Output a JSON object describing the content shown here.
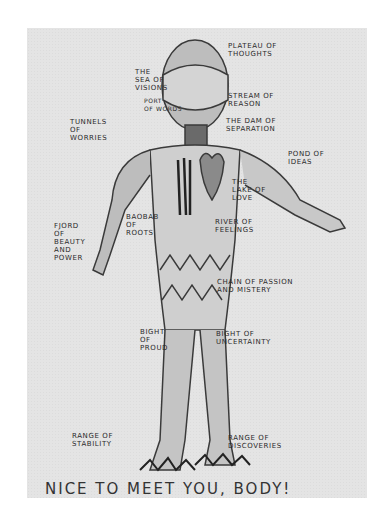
{
  "drawing": {
    "title_caption": "NICE TO MEET YOU, BODY!",
    "labels": {
      "plateau": "PLATEAU OF\nTHOUGHTS",
      "sea": "THE\nSEA OF\nVISIONS",
      "stream": "STREAM OF\nREASON",
      "words": "PORT\nOF WORDS",
      "tunnels": "TUNNELS\nOF\nWORRIES",
      "dam": "THE DAM OF\nSEPARATION",
      "pond": "POND OF\nIDEAS",
      "lake": "THE\nLAKE OF\nLOVE",
      "fjord": "FJORD\nOF\nBEAUTY\nAND\nPOWER",
      "baobab": "BAOBAB\nOF\nROOTS",
      "river": "RIVER OF\nFEELINGS",
      "chain": "CHAIN OF PASSION\nAND MISTERY",
      "bight_proud": "BIGHT\nOF\nPROUD",
      "bight_uncertainty": "BIGHT OF\nUNCERTAINTY",
      "range_stability": "RANGE OF\nSTABILITY",
      "range_discoveries": "RANGE OF\nDISCOVERIES"
    }
  }
}
